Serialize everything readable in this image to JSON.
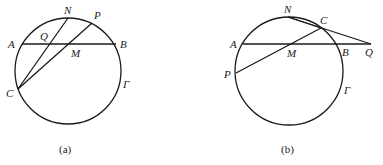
{
  "figures": [
    {
      "id": "a",
      "caption": "(a)",
      "circle_label": "Γ",
      "points": {
        "A": "A",
        "B": "B",
        "N": "N",
        "P": "P",
        "Q": "Q",
        "M": "M",
        "C": "C"
      },
      "segments": [
        "AB",
        "CN",
        "CP"
      ]
    },
    {
      "id": "b",
      "caption": "(b)",
      "circle_label": "Γ",
      "points": {
        "A": "A",
        "B": "B",
        "N": "N",
        "P": "P",
        "Q": "Q",
        "M": "M",
        "C": "C"
      },
      "segments": [
        "AQ",
        "PC",
        "NQ",
        "NC"
      ]
    }
  ],
  "colors": {
    "line": "#1a1a1a",
    "text": "#222222",
    "background": "#ffffff"
  }
}
